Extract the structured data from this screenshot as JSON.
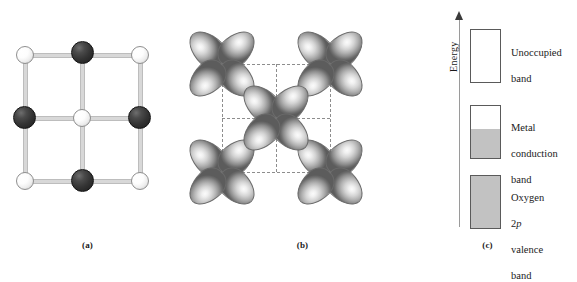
{
  "figure": {
    "panels": [
      {
        "id": "a",
        "caption": "(a)",
        "type": "crystal-lattice",
        "description": "Two-dimensional cubic lattice of alternating metal and oxygen atoms",
        "atoms": [
          {
            "kind": "white",
            "col": 0,
            "row": 0
          },
          {
            "kind": "dark",
            "col": 1,
            "row": 0
          },
          {
            "kind": "white",
            "col": 2,
            "row": 0
          },
          {
            "kind": "dark",
            "col": 0,
            "row": 1
          },
          {
            "kind": "white",
            "col": 1,
            "row": 1
          },
          {
            "kind": "dark",
            "col": 2,
            "row": 1
          },
          {
            "kind": "white",
            "col": 0,
            "row": 2
          },
          {
            "kind": "dark",
            "col": 1,
            "row": 2
          },
          {
            "kind": "white",
            "col": 2,
            "row": 2
          }
        ]
      },
      {
        "id": "b",
        "caption": "(b)",
        "type": "orbital-overlap",
        "description": "Metal d orbitals arranged on the lattice sites with dashed unit-cell outline",
        "orbitals": [
          {
            "col": 0,
            "row": 0
          },
          {
            "col": 1,
            "row": 0
          },
          {
            "col": 2,
            "row": 0
          },
          {
            "col": 0,
            "row": 1
          },
          {
            "col": 1,
            "row": 1
          },
          {
            "col": 2,
            "row": 1
          },
          {
            "col": 0,
            "row": 2
          },
          {
            "col": 1,
            "row": 2
          },
          {
            "col": 2,
            "row": 2
          }
        ]
      },
      {
        "id": "c",
        "caption": "(c)",
        "type": "energy-band-diagram",
        "axis_label": "Energy",
        "bands": [
          {
            "name": "unoccupied-band",
            "label": "Unoccupied\nband",
            "fill_fraction": 0.0
          },
          {
            "name": "metal-conduction-band",
            "label_lines": [
              "Metal",
              "conduction",
              "band"
            ],
            "fill_fraction": 0.55
          },
          {
            "name": "oxygen-2p-valence-band",
            "label_lines": [
              "Oxygen",
              "2p",
              "valence",
              "band"
            ],
            "fill_fraction": 1.0
          }
        ]
      }
    ]
  },
  "colors": {
    "atom_dark": "#2d2d2d",
    "atom_white": "#f2f2f2",
    "bond": "#d8d8d8",
    "band_fill": "#c2c2c2",
    "band_stroke": "#5a5a5a",
    "dashed_grid": "#8d8d8d",
    "axis": "#9a9a9a",
    "background": "#ffffff"
  },
  "labels": {
    "energy_axis": "Energy",
    "unoccupied": "Unoccupied",
    "band_word": "band",
    "metal": "Metal",
    "conduction": "conduction",
    "oxygen": "Oxygen",
    "two_p_number": "2",
    "two_p_letter": "p",
    "valence": "valence",
    "caption_a": "(a)",
    "caption_b": "(b)",
    "caption_c": "(c)"
  }
}
